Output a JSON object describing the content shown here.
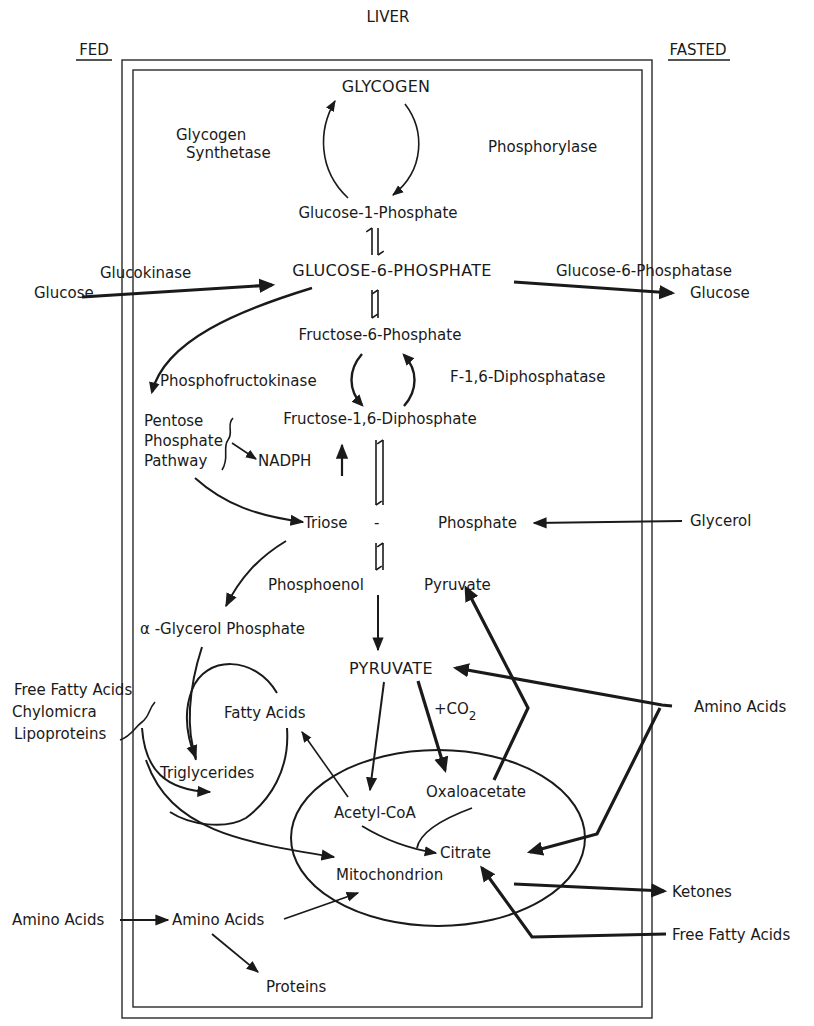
{
  "title": "LIVER",
  "columns": {
    "left": "FED",
    "right": "FASTED"
  },
  "nodes": {
    "glycogen": "GLYCOGEN",
    "glycogen_synthetase_1": "Glycogen",
    "glycogen_synthetase_2": "Synthetase",
    "phosphorylase": "Phosphorylase",
    "glucose_1_phosphate": "Glucose-1-Phosphate",
    "glucokinase": "Glucokinase",
    "glucose_in": "Glucose",
    "glucose_6_phosphate": "GLUCOSE-6-PHOSPHATE",
    "glucose_6_phosphatase": "Glucose-6-Phosphatase",
    "glucose_out": "Glucose",
    "fructose_6_phosphate": "Fructose-6-Phosphate",
    "phosphofructokinase": "Phosphofructokinase",
    "f16_diphosphatase": "F-1,6-Diphosphatase",
    "pentose_1": "Pentose",
    "pentose_2": "Phosphate",
    "pentose_3": "Pathway",
    "fructose_16_diphosphate": "Fructose-1,6-Diphosphate",
    "nadph": "NADPH",
    "triose": "Triose",
    "dash": "-",
    "phosphate": "Phosphate",
    "glycerol": "Glycerol",
    "phosphoenol": "Phosphoenol",
    "pyruvate_pep": "Pyruvate",
    "alpha_glycerol_phosphate": "α -Glycerol Phosphate",
    "pyruvate": "PYRUVATE",
    "co2": "+CO",
    "co2_sub": "2",
    "ffa_in_1": "Free Fatty Acids",
    "ffa_in_2": "Chylomicra",
    "ffa_in_3": "Lipoproteins",
    "fatty_acids": "Fatty Acids",
    "amino_acids_right": "Amino Acids",
    "triglycerides": "Triglycerides",
    "oxaloacetate": "Oxaloacetate",
    "acetyl_coa": "Acetyl-CoA",
    "citrate": "Citrate",
    "mitochondrion": "Mitochondrion",
    "ketones": "Ketones",
    "amino_acids_in": "Amino Acids",
    "amino_acids_mid": "Amino Acids",
    "free_fatty_acids_right": "Free Fatty Acids",
    "proteins": "Proteins"
  },
  "colors": {
    "ink": "#1a1a1a",
    "background": "#ffffff"
  }
}
